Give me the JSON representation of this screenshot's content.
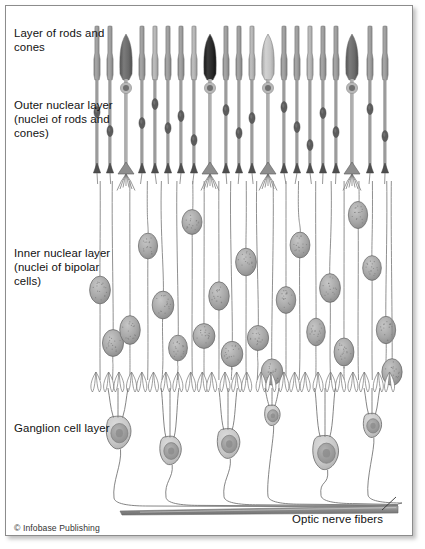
{
  "figure": {
    "credit": "© Infobase Publishing"
  },
  "labels": {
    "rods_and_cones": "Layer of rods and cones",
    "outer_nuclear": "Outer nuclear layer (nuclei of rods and cones)",
    "inner_nuclear": "Inner nuclear layer (nuclei of bipolar cells)",
    "ganglion": "Ganglion cell layer",
    "optic_nerve": "Optic nerve fibers"
  },
  "colors": {
    "frame_border": "#8c8c8c",
    "background": "#ffffff",
    "rod_body": "#9d9d9d",
    "rod_body_light": "#b4b4b4",
    "rod_outline": "#6f6f6f",
    "rod_nucleus": "#5c5c5c",
    "cone_dark": "#6b6b6b",
    "cone_black": "#2a2a2a",
    "cone_light": "#c2c2c2",
    "cone_nucleus_ring": "#b8b8b8",
    "cone_nucleus_core": "#707070",
    "bipolar_nucleus": "#a8a8a8",
    "bipolar_nucleus_edge": "#6a6a6a",
    "fiber": "#8a8a8a",
    "ganglion_soma": "#c9c9c9",
    "ganglion_nucleus": "#9a9a9a",
    "ganglion_outline": "#6f6f6f",
    "nerve_bundle": "#8f8f8f",
    "text": "#111111"
  },
  "geometry": {
    "canvas": {
      "width": 425,
      "height": 549
    },
    "frame": {
      "x": 5,
      "y": 5,
      "width": 408,
      "height": 531
    },
    "layers": {
      "photoreceptor_top": 26,
      "photoreceptor_bottom": 80,
      "outer_nuclear_top": 80,
      "outer_nuclear_bottom": 168,
      "outer_plexiform": 170,
      "inner_nuclear_top": 185,
      "inner_nuclear_bottom": 378,
      "inner_plexiform": 382,
      "ganglion_top": 392,
      "ganglion_bottom": 485,
      "nerve_fiber_y": 508
    },
    "column_span": {
      "left": 92,
      "right": 398
    }
  },
  "photoreceptors": [
    {
      "x": 97,
      "type": "rod",
      "shade": "mid",
      "nucleus_y": 112
    },
    {
      "x": 110,
      "type": "rod",
      "shade": "mid",
      "nucleus_y": 131
    },
    {
      "x": 126,
      "type": "cone",
      "shade": "dark",
      "nucleus_y": 88
    },
    {
      "x": 142,
      "type": "rod",
      "shade": "mid",
      "nucleus_y": 123
    },
    {
      "x": 155,
      "type": "rod",
      "shade": "light",
      "nucleus_y": 104
    },
    {
      "x": 168,
      "type": "rod",
      "shade": "mid",
      "nucleus_y": 128
    },
    {
      "x": 181,
      "type": "rod",
      "shade": "mid",
      "nucleus_y": 116
    },
    {
      "x": 194,
      "type": "rod",
      "shade": "light",
      "nucleus_y": 140
    },
    {
      "x": 210,
      "type": "cone",
      "shade": "black",
      "nucleus_y": 88
    },
    {
      "x": 226,
      "type": "rod",
      "shade": "mid",
      "nucleus_y": 110
    },
    {
      "x": 239,
      "type": "rod",
      "shade": "mid",
      "nucleus_y": 133
    },
    {
      "x": 252,
      "type": "rod",
      "shade": "light",
      "nucleus_y": 118
    },
    {
      "x": 268,
      "type": "cone",
      "shade": "light",
      "nucleus_y": 88
    },
    {
      "x": 284,
      "type": "rod",
      "shade": "mid",
      "nucleus_y": 107
    },
    {
      "x": 297,
      "type": "rod",
      "shade": "mid",
      "nucleus_y": 127
    },
    {
      "x": 310,
      "type": "rod",
      "shade": "light",
      "nucleus_y": 145
    },
    {
      "x": 323,
      "type": "rod",
      "shade": "mid",
      "nucleus_y": 113
    },
    {
      "x": 336,
      "type": "rod",
      "shade": "mid",
      "nucleus_y": 132
    },
    {
      "x": 352,
      "type": "cone",
      "shade": "dark",
      "nucleus_y": 88
    },
    {
      "x": 370,
      "type": "rod",
      "shade": "mid",
      "nucleus_y": 109
    },
    {
      "x": 385,
      "type": "rod",
      "shade": "mid",
      "nucleus_y": 136
    }
  ],
  "bipolar_cells": [
    {
      "x": 100,
      "y": 290
    },
    {
      "x": 113,
      "y": 343
    },
    {
      "x": 130,
      "y": 330
    },
    {
      "x": 148,
      "y": 246
    },
    {
      "x": 163,
      "y": 305
    },
    {
      "x": 178,
      "y": 348
    },
    {
      "x": 192,
      "y": 222
    },
    {
      "x": 204,
      "y": 336
    },
    {
      "x": 219,
      "y": 296
    },
    {
      "x": 232,
      "y": 354
    },
    {
      "x": 246,
      "y": 262
    },
    {
      "x": 258,
      "y": 338
    },
    {
      "x": 272,
      "y": 372
    },
    {
      "x": 286,
      "y": 300
    },
    {
      "x": 300,
      "y": 245
    },
    {
      "x": 316,
      "y": 332
    },
    {
      "x": 330,
      "y": 288
    },
    {
      "x": 344,
      "y": 352
    },
    {
      "x": 358,
      "y": 215
    },
    {
      "x": 372,
      "y": 268
    },
    {
      "x": 386,
      "y": 330
    },
    {
      "x": 392,
      "y": 372
    }
  ],
  "ganglion_cells": [
    {
      "x": 118,
      "y": 432,
      "size": 1.15
    },
    {
      "x": 170,
      "y": 450,
      "size": 1.0
    },
    {
      "x": 228,
      "y": 443,
      "size": 1.05
    },
    {
      "x": 272,
      "y": 415,
      "size": 0.72
    },
    {
      "x": 325,
      "y": 452,
      "size": 1.2
    },
    {
      "x": 372,
      "y": 425,
      "size": 0.85
    }
  ]
}
